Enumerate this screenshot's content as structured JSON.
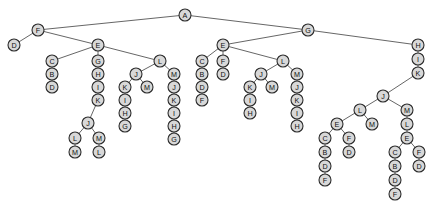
{
  "diagram": {
    "type": "tree",
    "background_color": "#ffffff",
    "node_fill_color": "#d8d8d8",
    "node_stroke_color": "#2b2b2b",
    "edge_color": "#555555",
    "node_radius": 6,
    "root": "n0",
    "nodes": [
      {
        "id": "n0",
        "label": "A",
        "x": 185,
        "y": 15
      },
      {
        "id": "n1",
        "label": "F",
        "x": 38,
        "y": 30
      },
      {
        "id": "n2",
        "label": "G",
        "x": 308,
        "y": 30
      },
      {
        "id": "n3",
        "label": "D",
        "x": 14,
        "y": 45
      },
      {
        "id": "n4",
        "label": "E",
        "x": 98,
        "y": 45
      },
      {
        "id": "n5",
        "label": "C",
        "x": 52,
        "y": 61
      },
      {
        "id": "n6",
        "label": "B",
        "x": 52,
        "y": 74
      },
      {
        "id": "n7",
        "label": "D",
        "x": 52,
        "y": 87
      },
      {
        "id": "n8",
        "label": "G",
        "x": 98,
        "y": 61
      },
      {
        "id": "n9",
        "label": "H",
        "x": 98,
        "y": 74
      },
      {
        "id": "n10",
        "label": "I",
        "x": 98,
        "y": 87
      },
      {
        "id": "n11",
        "label": "K",
        "x": 98,
        "y": 100
      },
      {
        "id": "n12",
        "label": "J",
        "x": 88,
        "y": 123
      },
      {
        "id": "n13",
        "label": "L",
        "x": 75,
        "y": 138
      },
      {
        "id": "n14",
        "label": "M",
        "x": 75,
        "y": 152
      },
      {
        "id": "n15",
        "label": "M",
        "x": 99,
        "y": 138
      },
      {
        "id": "n16",
        "label": "L",
        "x": 99,
        "y": 152
      },
      {
        "id": "n17",
        "label": "L",
        "x": 160,
        "y": 61
      },
      {
        "id": "n18",
        "label": "J",
        "x": 136,
        "y": 74
      },
      {
        "id": "n19",
        "label": "K",
        "x": 125,
        "y": 87
      },
      {
        "id": "n20",
        "label": "I",
        "x": 125,
        "y": 100
      },
      {
        "id": "n21",
        "label": "H",
        "x": 125,
        "y": 113
      },
      {
        "id": "n22",
        "label": "G",
        "x": 125,
        "y": 126
      },
      {
        "id": "n23",
        "label": "M",
        "x": 147,
        "y": 87
      },
      {
        "id": "n24",
        "label": "M",
        "x": 174,
        "y": 74
      },
      {
        "id": "n25",
        "label": "J",
        "x": 174,
        "y": 87
      },
      {
        "id": "n26",
        "label": "K",
        "x": 174,
        "y": 100
      },
      {
        "id": "n27",
        "label": "I",
        "x": 174,
        "y": 113
      },
      {
        "id": "n28",
        "label": "H",
        "x": 174,
        "y": 126
      },
      {
        "id": "n29",
        "label": "G",
        "x": 174,
        "y": 139
      },
      {
        "id": "n30",
        "label": "E",
        "x": 223,
        "y": 45
      },
      {
        "id": "n31",
        "label": "C",
        "x": 202,
        "y": 61
      },
      {
        "id": "n32",
        "label": "B",
        "x": 202,
        "y": 74
      },
      {
        "id": "n33",
        "label": "D",
        "x": 202,
        "y": 87
      },
      {
        "id": "n34",
        "label": "F",
        "x": 202,
        "y": 100
      },
      {
        "id": "n35",
        "label": "F",
        "x": 223,
        "y": 61
      },
      {
        "id": "n36",
        "label": "D",
        "x": 223,
        "y": 74
      },
      {
        "id": "n37",
        "label": "L",
        "x": 283,
        "y": 61
      },
      {
        "id": "n38",
        "label": "J",
        "x": 261,
        "y": 74
      },
      {
        "id": "n39",
        "label": "K",
        "x": 250,
        "y": 87
      },
      {
        "id": "n40",
        "label": "I",
        "x": 250,
        "y": 100
      },
      {
        "id": "n41",
        "label": "H",
        "x": 250,
        "y": 113
      },
      {
        "id": "n42",
        "label": "M",
        "x": 272,
        "y": 87
      },
      {
        "id": "n43",
        "label": "M",
        "x": 297,
        "y": 74
      },
      {
        "id": "n44",
        "label": "J",
        "x": 297,
        "y": 87
      },
      {
        "id": "n45",
        "label": "K",
        "x": 297,
        "y": 100
      },
      {
        "id": "n46",
        "label": "I",
        "x": 297,
        "y": 113
      },
      {
        "id": "n47",
        "label": "H",
        "x": 297,
        "y": 126
      },
      {
        "id": "n48",
        "label": "H",
        "x": 418,
        "y": 45
      },
      {
        "id": "n49",
        "label": "I",
        "x": 418,
        "y": 59
      },
      {
        "id": "n50",
        "label": "K",
        "x": 418,
        "y": 73
      },
      {
        "id": "n51",
        "label": "J",
        "x": 383,
        "y": 96
      },
      {
        "id": "n52",
        "label": "L",
        "x": 360,
        "y": 110
      },
      {
        "id": "n53",
        "label": "E",
        "x": 337,
        "y": 124
      },
      {
        "id": "n54",
        "label": "C",
        "x": 325,
        "y": 138
      },
      {
        "id": "n55",
        "label": "B",
        "x": 325,
        "y": 152
      },
      {
        "id": "n56",
        "label": "D",
        "x": 325,
        "y": 166
      },
      {
        "id": "n57",
        "label": "F",
        "x": 325,
        "y": 180
      },
      {
        "id": "n58",
        "label": "F",
        "x": 349,
        "y": 138
      },
      {
        "id": "n59",
        "label": "D",
        "x": 349,
        "y": 152
      },
      {
        "id": "n60",
        "label": "M",
        "x": 372,
        "y": 124
      },
      {
        "id": "n61",
        "label": "M",
        "x": 407,
        "y": 110
      },
      {
        "id": "n62",
        "label": "L",
        "x": 407,
        "y": 124
      },
      {
        "id": "n63",
        "label": "E",
        "x": 407,
        "y": 138
      },
      {
        "id": "n64",
        "label": "C",
        "x": 395,
        "y": 152
      },
      {
        "id": "n65",
        "label": "B",
        "x": 395,
        "y": 166
      },
      {
        "id": "n66",
        "label": "D",
        "x": 395,
        "y": 180
      },
      {
        "id": "n67",
        "label": "F",
        "x": 395,
        "y": 194
      },
      {
        "id": "n68",
        "label": "F",
        "x": 419,
        "y": 152
      },
      {
        "id": "n69",
        "label": "D",
        "x": 419,
        "y": 166
      }
    ],
    "edges": [
      [
        "n0",
        "n1"
      ],
      [
        "n0",
        "n2"
      ],
      [
        "n1",
        "n3"
      ],
      [
        "n1",
        "n4"
      ],
      [
        "n4",
        "n5"
      ],
      [
        "n4",
        "n8"
      ],
      [
        "n4",
        "n17"
      ],
      [
        "n5",
        "n6"
      ],
      [
        "n6",
        "n7"
      ],
      [
        "n8",
        "n9"
      ],
      [
        "n9",
        "n10"
      ],
      [
        "n10",
        "n11"
      ],
      [
        "n11",
        "n12"
      ],
      [
        "n12",
        "n13"
      ],
      [
        "n13",
        "n14"
      ],
      [
        "n12",
        "n15"
      ],
      [
        "n15",
        "n16"
      ],
      [
        "n17",
        "n18"
      ],
      [
        "n17",
        "n24"
      ],
      [
        "n18",
        "n19"
      ],
      [
        "n18",
        "n23"
      ],
      [
        "n19",
        "n20"
      ],
      [
        "n20",
        "n21"
      ],
      [
        "n21",
        "n22"
      ],
      [
        "n24",
        "n25"
      ],
      [
        "n25",
        "n26"
      ],
      [
        "n26",
        "n27"
      ],
      [
        "n27",
        "n28"
      ],
      [
        "n28",
        "n29"
      ],
      [
        "n2",
        "n30"
      ],
      [
        "n2",
        "n48"
      ],
      [
        "n30",
        "n31"
      ],
      [
        "n30",
        "n35"
      ],
      [
        "n30",
        "n37"
      ],
      [
        "n31",
        "n32"
      ],
      [
        "n32",
        "n33"
      ],
      [
        "n33",
        "n34"
      ],
      [
        "n35",
        "n36"
      ],
      [
        "n37",
        "n38"
      ],
      [
        "n37",
        "n43"
      ],
      [
        "n38",
        "n39"
      ],
      [
        "n38",
        "n42"
      ],
      [
        "n39",
        "n40"
      ],
      [
        "n40",
        "n41"
      ],
      [
        "n43",
        "n44"
      ],
      [
        "n44",
        "n45"
      ],
      [
        "n45",
        "n46"
      ],
      [
        "n46",
        "n47"
      ],
      [
        "n48",
        "n49"
      ],
      [
        "n49",
        "n50"
      ],
      [
        "n50",
        "n51"
      ],
      [
        "n51",
        "n52"
      ],
      [
        "n51",
        "n61"
      ],
      [
        "n52",
        "n53"
      ],
      [
        "n52",
        "n60"
      ],
      [
        "n53",
        "n54"
      ],
      [
        "n53",
        "n58"
      ],
      [
        "n54",
        "n55"
      ],
      [
        "n55",
        "n56"
      ],
      [
        "n56",
        "n57"
      ],
      [
        "n58",
        "n59"
      ],
      [
        "n61",
        "n62"
      ],
      [
        "n62",
        "n63"
      ],
      [
        "n63",
        "n64"
      ],
      [
        "n63",
        "n68"
      ],
      [
        "n64",
        "n65"
      ],
      [
        "n65",
        "n66"
      ],
      [
        "n66",
        "n67"
      ],
      [
        "n68",
        "n69"
      ]
    ]
  }
}
